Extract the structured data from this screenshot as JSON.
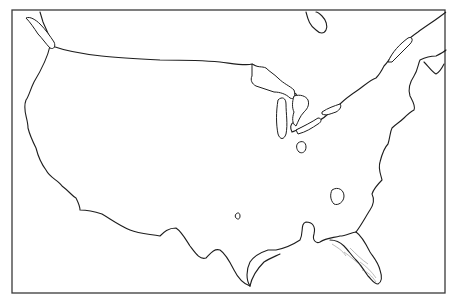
{
  "map": {
    "type": "outline-basemap",
    "region": "Contiguous United States",
    "labels": [],
    "colors": {
      "background": "#ffffff",
      "outline": "#1e1e1e",
      "frame": "#3a3a3a",
      "contour": "#777777"
    },
    "frame": {
      "x": 12,
      "y": 10,
      "width": 433,
      "height": 283
    },
    "paths": {
      "west_coast_and_mexico_border": "M40,12 L43,22 C46,30 52,38 50,46 C47,60 40,72 34,82 C30,90 29,96 26,100 C22,110 28,118 28,128 C30,136 32,140 36,148 C38,156 40,162 46,170 C50,178 58,180 62,186 C70,192 72,196 76,198 C78,202 80,206 80,210 C86,210 96,212 102,214 C112,220 120,226 130,230 C140,234 150,234 160,236 C164,232 168,228 176,228 C182,232 186,240 190,246 C196,254 200,260 206,258 C210,254 214,248 220,250 C226,254 230,262 234,270 C238,278 244,284 250,286",
      "gulf_coast": "M250,286 C246,280 246,270 250,262 C254,256 262,252 268,250 L276,250 C286,248 294,244 300,240 C304,232 300,224 306,222 C312,222 316,226 314,234 C312,240 316,244 320,242 C326,238 332,238 340,236 C346,236 352,232 356,232",
      "gulf_coast_bay": "M250,286 C252,276 258,268 264,262 C270,258 276,256 280,254",
      "florida": "M356,232 C362,236 366,244 370,252 C374,258 378,262 380,270 C382,276 382,282 378,284 C374,284 372,280 368,276 C364,270 360,264 356,260 C352,256 348,250 344,246 C340,242 334,240 330,240",
      "east_coast": "M356,232 C362,224 366,216 370,210 C374,204 374,198 372,194 C374,188 378,184 382,180 C380,172 378,168 380,162 C382,154 384,148 388,144 C390,138 390,132 392,128 C396,124 400,122 404,118 C408,114 410,112 414,110 C416,106 412,100 410,96 C408,90 410,82 414,76 C418,70 418,64 420,60 C424,58 430,56 436,56 C440,54 444,52 446,50",
      "canada_border": "M52,46 C80,56 120,58 160,60 C180,60 200,60 220,62 C236,64 246,66 252,64 C256,66 262,70 268,72 C272,78 272,84 278,86 C284,88 290,90 296,94 C300,100 300,108 296,110 C294,114 296,118 294,122 C290,124 290,128 292,132 C298,130 304,126 310,124 C318,122 324,118 328,114 C334,112 338,110 340,104 C346,98 352,94 358,90 C364,86 370,80 376,78 C380,74 382,70 384,66 C388,62 390,58 392,56 C396,50 400,48 402,44 C408,40 412,36 418,32 C426,26 436,20 446,12",
      "puget_sound_island": "M26,18 C30,22 34,28 38,34 C42,38 46,44 50,48 C54,50 56,46 54,42 C50,36 46,30 40,24 C36,20 30,16 26,18 Z",
      "lake_superior": "M252,64 C258,68 262,66 266,68 C270,72 274,74 278,78 C284,84 290,86 294,90 C296,96 294,100 290,98 C286,94 280,92 274,92 C268,90 262,88 256,86 C252,84 250,80 252,76 Z",
      "lake_michigan": "M278,100 C282,96 286,98 286,104 C286,114 288,124 286,134 C284,140 280,140 278,134 C276,124 276,112 278,100 Z",
      "lake_huron": "M294,96 C300,94 306,96 308,100 C310,106 306,110 304,112 C300,116 298,122 296,126 C292,124 292,118 294,112 C292,108 292,102 294,96 Z",
      "lake_erie": "M296,130 C304,126 312,122 318,118 C322,118 322,122 318,124 C312,128 306,132 298,134 Z",
      "lake_ontario": "M322,112 C328,108 334,106 340,104 C342,106 340,110 336,112 C330,114 326,116 322,114 Z",
      "hudson_bay_fragment": "M306,12 C308,20 310,26 316,30 C320,34 324,34 326,30 C328,26 326,20 322,16 C320,14 318,12 316,12",
      "st_lawrence_gulf": "M388,62 C392,52 400,44 408,38 C412,36 414,40 410,44 C404,50 398,56 392,62 Z",
      "nova_scotia": "M424,62 C428,66 432,72 436,74 C440,72 442,68 444,64",
      "great_salt_like_oval": "M298,143 C302,140 306,142 306,147 C306,152 302,154 299,152 C296,149 296,145 298,143 Z",
      "carolina_oval": "M332,190 C338,186 344,190 344,196 C344,202 338,206 334,204 C330,200 330,194 332,190 Z",
      "small_lake_oval": "M236,214 C238,212 240,213 240,216 C240,219 238,220 236,218 C235,217 235,215 236,214 Z",
      "florida_contours": "M344,252 C350,256 356,262 362,266 M350,248 C356,254 362,260 368,264 M360,262 C366,266 372,272 376,278 M362,270 C368,272 372,276 376,282 M332,244 C338,248 342,250 346,256"
    }
  }
}
